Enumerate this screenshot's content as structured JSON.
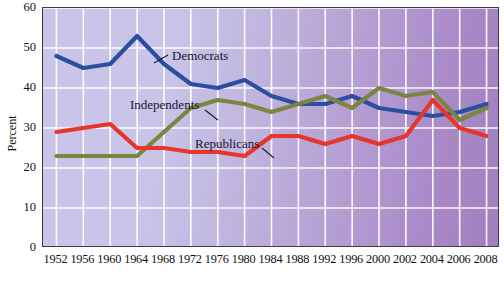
{
  "chart_data": {
    "type": "line",
    "title": "",
    "xlabel": "",
    "ylabel": "Percent",
    "ylim": [
      0,
      60
    ],
    "yticks": [
      0,
      10,
      20,
      30,
      40,
      50,
      60
    ],
    "grid": true,
    "legend_position": "inline-annotations",
    "background": "purple-gradient",
    "categories": [
      "1952",
      "1956",
      "1960",
      "1964",
      "1968",
      "1972",
      "1976",
      "1980",
      "1984",
      "1988",
      "1992",
      "1996",
      "2000",
      "2002",
      "2004",
      "2006",
      "2008"
    ],
    "series": [
      {
        "name": "Democrats",
        "color": "#2b4f9e",
        "values": [
          48,
          45,
          46,
          53,
          46,
          41,
          40,
          42,
          38,
          36,
          36,
          38,
          35,
          34,
          33,
          34,
          36
        ]
      },
      {
        "name": "Independents",
        "color": "#7b8540",
        "values": [
          23,
          23,
          23,
          23,
          29,
          35,
          37,
          36,
          34,
          36,
          38,
          35,
          40,
          38,
          39,
          32,
          35
        ]
      },
      {
        "name": "Republicans",
        "color": "#e8352b",
        "values": [
          29,
          30,
          31,
          25,
          25,
          24,
          24,
          23,
          28,
          28,
          26,
          28,
          26,
          28,
          37,
          30,
          28
        ]
      }
    ],
    "annotations": [
      {
        "name": "Democrats",
        "text": "Democrats"
      },
      {
        "name": "Independents",
        "text": "Independents"
      },
      {
        "name": "Republicans",
        "text": "Republicans"
      }
    ]
  },
  "axis": {
    "y_title": "Percent",
    "y_ticks": [
      "60",
      "50",
      "40",
      "30",
      "20",
      "10",
      "0"
    ],
    "x_ticks": [
      "1952",
      "1956",
      "1960",
      "1964",
      "1968",
      "1972",
      "1976",
      "1980",
      "1984",
      "1988",
      "1992",
      "1996",
      "2000",
      "2002",
      "2004",
      "2006",
      "2008"
    ]
  },
  "labels": {
    "democrats": "Democrats",
    "independents": "Independents",
    "republicans": "Republicans"
  },
  "colors": {
    "democrats": "#2b4f9e",
    "independents": "#7b8540",
    "republicans": "#e8352b",
    "grid": "#ffffff",
    "frame": "#3b3b4a"
  }
}
